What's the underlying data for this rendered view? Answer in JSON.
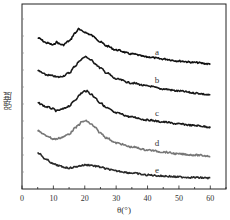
{
  "chart_data": {
    "type": "line",
    "title": "",
    "xlabel": "θ(°)",
    "ylabel": "强度",
    "xlim": [
      0,
      65
    ],
    "xticks": [
      0,
      10,
      20,
      30,
      40,
      50,
      60
    ],
    "xtick_labels": [
      "0",
      "10",
      "20",
      "30",
      "40",
      "50",
      "60"
    ],
    "yticks_labeled": false,
    "grid": false,
    "legend": "inline labels at right of each curve",
    "stacked_offset": true,
    "x": [
      5,
      8,
      10,
      11,
      12,
      13,
      15,
      17,
      18,
      19,
      20,
      20.5,
      22,
      23,
      25,
      27,
      30,
      35,
      40,
      45,
      50,
      55,
      60
    ],
    "series": [
      {
        "name": "a",
        "color": "#111111",
        "values": [
          38,
          43,
          45,
          42,
          44,
          45,
          41,
          33,
          29,
          31,
          32,
          33,
          35,
          37,
          42,
          46,
          50,
          54,
          57,
          59,
          61,
          62.5,
          64
        ]
      },
      {
        "name": "b",
        "color": "#1a1a1a",
        "values": [
          71,
          75,
          76,
          77,
          77,
          76,
          73,
          66,
          62,
          59,
          57,
          57,
          60,
          63,
          68,
          73,
          79,
          83,
          86,
          89,
          91,
          93,
          95
        ]
      },
      {
        "name": "c",
        "color": "#1a1a1a",
        "values": [
          103,
          107,
          109,
          111,
          110,
          109,
          106,
          100,
          96,
          93,
          91,
          91,
          94,
          97,
          103,
          108,
          113,
          117,
          120,
          122,
          124,
          125.5,
          127
        ]
      },
      {
        "name": "d",
        "color": "#777777",
        "values": [
          131,
          136,
          139,
          139,
          138,
          137,
          134,
          128,
          125,
          122,
          121,
          121,
          124,
          127,
          133,
          138,
          143,
          147,
          150,
          152,
          154,
          155,
          156
        ]
      },
      {
        "name": "e",
        "color": "#2a2a2a",
        "values": [
          153,
          160,
          164,
          165,
          166,
          167,
          168,
          167,
          166,
          165.5,
          165,
          165,
          165,
          166,
          167,
          169,
          171,
          173,
          175,
          176,
          177,
          177.5,
          178
        ]
      }
    ],
    "curve_labels": [
      {
        "text": "a",
        "x": 157,
        "y": 55
      },
      {
        "text": "b",
        "x": 157,
        "y": 83
      },
      {
        "text": "c",
        "x": 157,
        "y": 116
      },
      {
        "text": "d",
        "x": 157,
        "y": 146
      },
      {
        "text": "e",
        "x": 157,
        "y": 173
      }
    ]
  }
}
